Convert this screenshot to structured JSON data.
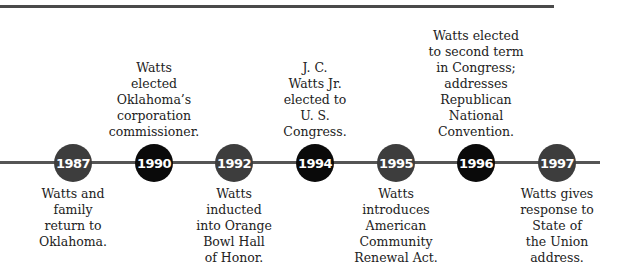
{
  "events": [
    {
      "year": "1987",
      "text": "Watts and\nfamily\nreturn to\nOklahoma.",
      "position": "below",
      "style": "gray"
    },
    {
      "year": "1990",
      "text": "Watts\nelected\nOklahoma’s\ncorporation\ncommissioner.",
      "position": "above",
      "style": "black"
    },
    {
      "year": "1992",
      "text": "Watts\ninducted\ninto Orange\nBowl Hall\nof Honor.",
      "position": "below",
      "style": "gray"
    },
    {
      "year": "1994",
      "text": "J. C.\nWatts Jr.\nelected to\nU. S.\nCongress.",
      "position": "above",
      "style": "black"
    },
    {
      "year": "1995",
      "text": "Watts\nintroduces\nAmerican\nCommunity\nRenewal Act.",
      "position": "below",
      "style": "gray"
    },
    {
      "year": "1996",
      "text": "Watts elected\nto second term\nin Congress;\naddresses\nRepublican\nNational\nConvention.",
      "position": "above",
      "style": "black"
    },
    {
      "year": "1997",
      "text": "Watts gives\nresponse to\nState of\nthe Union\naddress.",
      "position": "below",
      "style": "gray"
    }
  ],
  "colors": {
    "gray_node": "#3d3d3d",
    "black_node": "#0a0a0a",
    "line": "#555555"
  }
}
